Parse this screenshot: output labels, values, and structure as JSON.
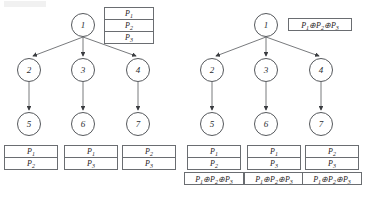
{
  "figure": {
    "background_color": "#ffffff",
    "stroke_color": "#55585c",
    "text_color": "#1f2123",
    "trees": [
      {
        "id": "left-tree",
        "name": "tree-without-xor-encoding",
        "root": {
          "label": "1"
        },
        "root_table": {
          "name": "root-packet-table",
          "rows": [
            {
              "text": "P",
              "sub": "1"
            },
            {
              "text": "P",
              "sub": "2"
            },
            {
              "text": "P",
              "sub": "3"
            }
          ]
        },
        "middle_nodes": [
          {
            "label": "2"
          },
          {
            "label": "3"
          },
          {
            "label": "4"
          }
        ],
        "leaf_nodes": [
          {
            "label": "5"
          },
          {
            "label": "6"
          },
          {
            "label": "7"
          }
        ],
        "leaf_tables": [
          {
            "name": "leaf-5-packet-table",
            "rows": [
              {
                "text": "P",
                "sub": "1"
              },
              {
                "text": "P",
                "sub": "2"
              }
            ]
          },
          {
            "name": "leaf-6-packet-table",
            "rows": [
              {
                "text": "P",
                "sub": "1"
              },
              {
                "text": "P",
                "sub": "3"
              }
            ]
          },
          {
            "name": "leaf-7-packet-table",
            "rows": [
              {
                "text": "P",
                "sub": "2"
              },
              {
                "text": "P",
                "sub": "3"
              }
            ]
          }
        ],
        "leaf_formulas": []
      },
      {
        "id": "right-tree",
        "name": "tree-with-xor-encoding",
        "root": {
          "label": "1"
        },
        "root_formula": {
          "name": "root-xor-formula",
          "parts": [
            {
              "text": "P",
              "sub": "1"
            },
            {
              "op": "⊕"
            },
            {
              "text": "P",
              "sub": "2"
            },
            {
              "op": "⊕"
            },
            {
              "text": "P",
              "sub": "3"
            }
          ]
        },
        "middle_nodes": [
          {
            "label": "2"
          },
          {
            "label": "3"
          },
          {
            "label": "4"
          }
        ],
        "leaf_nodes": [
          {
            "label": "5"
          },
          {
            "label": "6"
          },
          {
            "label": "7"
          }
        ],
        "leaf_tables": [
          {
            "name": "leaf-5-packet-table",
            "rows": [
              {
                "text": "P",
                "sub": "1"
              },
              {
                "text": "P",
                "sub": "2"
              }
            ]
          },
          {
            "name": "leaf-6-packet-table",
            "rows": [
              {
                "text": "P",
                "sub": "1"
              },
              {
                "text": "P",
                "sub": "3"
              }
            ]
          },
          {
            "name": "leaf-7-packet-table",
            "rows": [
              {
                "text": "P",
                "sub": "2"
              },
              {
                "text": "P",
                "sub": "3"
              }
            ]
          }
        ],
        "leaf_formulas": [
          {
            "name": "leaf-5-xor-formula",
            "parts": [
              {
                "text": "P",
                "sub": "1"
              },
              {
                "op": "⊕"
              },
              {
                "text": "P",
                "sub": "2"
              },
              {
                "op": "⊕"
              },
              {
                "text": "P",
                "sub": "3"
              }
            ]
          },
          {
            "name": "leaf-6-xor-formula",
            "parts": [
              {
                "text": "P",
                "sub": "1"
              },
              {
                "op": "⊕"
              },
              {
                "text": "P",
                "sub": "2"
              },
              {
                "op": "⊕"
              },
              {
                "text": "P",
                "sub": "3"
              }
            ]
          },
          {
            "name": "leaf-7-xor-formula",
            "parts": [
              {
                "text": "P",
                "sub": "1"
              },
              {
                "op": "⊕"
              },
              {
                "text": "P",
                "sub": "2"
              },
              {
                "op": "⊕"
              },
              {
                "text": "P",
                "sub": "3"
              }
            ]
          }
        ]
      }
    ]
  }
}
